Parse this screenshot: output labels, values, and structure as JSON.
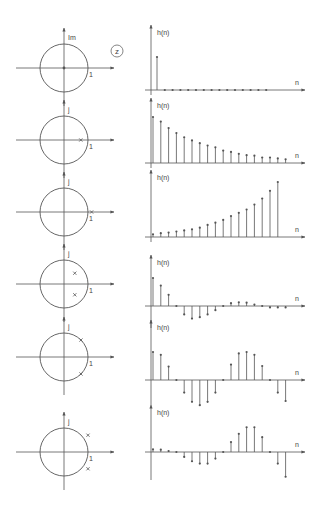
{
  "figure": {
    "z_label": "z",
    "colors": {
      "ink": "#555555",
      "background": "#ffffff"
    }
  },
  "rows": [
    {
      "id": "origin",
      "zplane": {
        "imag_label": "Im",
        "real_label": "1",
        "poles": [
          [
            0,
            0
          ]
        ]
      },
      "plot": {
        "ylabel": "h(n)",
        "xlabel": "n",
        "values": [
          1.0,
          0,
          0,
          0,
          0,
          0,
          0,
          0,
          0,
          0,
          0,
          0,
          0,
          0,
          0
        ]
      }
    },
    {
      "id": "real-inside",
      "zplane": {
        "imag_label": "j",
        "real_label": "1",
        "poles": [
          [
            0.7,
            0
          ]
        ]
      },
      "plot": {
        "ylabel": "h(n)",
        "xlabel": "n",
        "values": [
          1.0,
          0.9,
          0.76,
          0.65,
          0.56,
          0.49,
          0.43,
          0.38,
          0.34,
          0.27,
          0.24,
          0.2,
          0.17,
          0.16,
          0.12,
          0.12,
          0.1,
          0.08
        ]
      }
    },
    {
      "id": "real-outside",
      "zplane": {
        "imag_label": "j",
        "real_label": "1",
        "poles": [
          [
            1.15,
            0
          ]
        ]
      },
      "plot": {
        "ylabel": "h(n)",
        "xlabel": "n",
        "values": [
          0.05,
          0.07,
          0.08,
          0.1,
          0.12,
          0.14,
          0.17,
          0.22,
          0.26,
          0.31,
          0.38,
          0.44,
          0.5,
          0.59,
          0.7,
          0.84,
          1.0
        ]
      }
    },
    {
      "id": "complex-inside",
      "zplane": {
        "imag_label": "j",
        "real_label": "1",
        "poles": [
          [
            0.45,
            0.45
          ],
          [
            0.45,
            -0.45
          ]
        ]
      },
      "plot": {
        "ylabel": "h(n)",
        "xlabel": "n",
        "values": [
          1.0,
          0.73,
          0.4,
          0,
          -0.3,
          -0.45,
          -0.4,
          -0.3,
          -0.15,
          0,
          0.1,
          0.13,
          0.12,
          0.05,
          0,
          -0.05,
          -0.05,
          -0.05
        ]
      }
    },
    {
      "id": "complex-on-circle",
      "zplane": {
        "imag_label": "j",
        "real_label": "1",
        "poles": [
          [
            0.707,
            0.707
          ],
          [
            0.707,
            -0.707
          ]
        ]
      },
      "plot": {
        "ylabel": "h(n)",
        "xlabel": "n",
        "values": [
          1.0,
          0.9,
          0.48,
          0,
          -0.45,
          -0.78,
          -0.9,
          -0.78,
          -0.45,
          0,
          0.55,
          0.95,
          1.0,
          0.9,
          0.5,
          0,
          -0.45,
          -0.75
        ]
      }
    },
    {
      "id": "complex-outside",
      "zplane": {
        "imag_label": "j",
        "real_label": "1",
        "poles": [
          [
            1.0,
            0.7
          ],
          [
            1.0,
            -0.7
          ]
        ]
      },
      "plot": {
        "ylabel": "h(n)",
        "xlabel": "n",
        "values": [
          0.08,
          0.07,
          0.03,
          0,
          -0.15,
          -0.28,
          -0.35,
          -0.35,
          -0.2,
          0,
          0.3,
          0.55,
          0.75,
          0.75,
          0.45,
          0,
          -0.35,
          -0.75
        ]
      }
    }
  ]
}
